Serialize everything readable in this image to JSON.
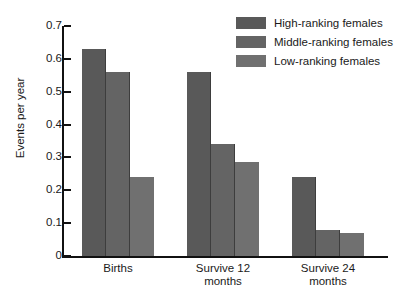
{
  "chart_data": {
    "type": "bar",
    "title": "",
    "xlabel": "",
    "ylabel": "Events per year",
    "ylim": [
      0,
      0.7
    ],
    "ytick_labels": [
      "0.7",
      "0.6",
      "0.5",
      "0.4",
      "0.3",
      "0.2",
      "0.1",
      "0"
    ],
    "ytick_values": [
      0.7,
      0.6,
      0.5,
      0.4,
      0.3,
      0.2,
      0.1,
      0
    ],
    "grid": false,
    "legend_position": "top-right",
    "categories": [
      "Births",
      "Survive 12 months",
      "Survive 24 months"
    ],
    "category_lines": [
      [
        "Births"
      ],
      [
        "Survive 12",
        "months"
      ],
      [
        "Survive 24",
        "months"
      ]
    ],
    "series": [
      {
        "name": "High-ranking females",
        "color": "#595959",
        "values": [
          0.63,
          0.56,
          0.24
        ]
      },
      {
        "name": "Middle-ranking females",
        "color": "#646464",
        "values": [
          0.56,
          0.34,
          0.08
        ]
      },
      {
        "name": "Low-ranking females",
        "color": "#707070",
        "values": [
          0.24,
          0.285,
          0.07
        ]
      }
    ]
  },
  "axis": {
    "y_label": "Events per year"
  },
  "legend": {
    "items": [
      {
        "label": "High-ranking females",
        "color": "#595959"
      },
      {
        "label": "Middle-ranking females",
        "color": "#646464"
      },
      {
        "label": "Low-ranking females",
        "color": "#707070"
      }
    ]
  }
}
